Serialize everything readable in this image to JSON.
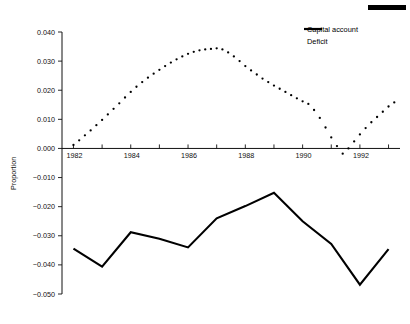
{
  "figure": {
    "artifact_bar": "page-edge-rule"
  },
  "chart_data": {
    "type": "line",
    "title": "",
    "xlabel": "",
    "ylabel": "Proportion",
    "xlim": [
      1981.6,
      1993.4
    ],
    "ylim": [
      -0.05,
      0.04
    ],
    "grid": false,
    "legend_position": "top-right",
    "yticks": [
      0.04,
      0.03,
      0.02,
      0.01,
      0.0,
      -0.01,
      -0.02,
      -0.03,
      -0.04,
      -0.05
    ],
    "ytick_labels": [
      "0.040",
      "0.030",
      "0.020",
      "0.010",
      "0.000",
      "-0.010",
      "-0.020",
      "-0.030",
      "-0.040",
      "-0.050"
    ],
    "xticks": [
      1982,
      1983,
      1984,
      1985,
      1986,
      1987,
      1988,
      1989,
      1990,
      1991,
      1992,
      1993
    ],
    "xtick_labels": [
      "1982",
      "",
      "1984",
      "",
      "1986",
      "",
      "1988",
      "",
      "1990",
      "",
      "1992",
      ""
    ],
    "series": [
      {
        "name": "Capital account",
        "style": "dotted",
        "x": [
          1982.0,
          1982.2,
          1982.4,
          1982.6,
          1982.8,
          1983.0,
          1983.2,
          1983.4,
          1983.6,
          1983.8,
          1984.0,
          1984.2,
          1984.4,
          1984.6,
          1984.8,
          1985.0,
          1985.2,
          1985.4,
          1985.6,
          1985.8,
          1986.0,
          1986.2,
          1986.4,
          1986.6,
          1986.8,
          1987.0,
          1987.2,
          1987.4,
          1987.6,
          1987.8,
          1988.0,
          1988.2,
          1988.4,
          1988.6,
          1988.8,
          1989.0,
          1989.2,
          1989.4,
          1989.6,
          1989.8,
          1990.0,
          1990.2,
          1990.4,
          1990.6,
          1990.8,
          1991.0,
          1991.2,
          1991.4,
          1991.6,
          1991.8,
          1992.0,
          1992.2,
          1992.4,
          1992.6,
          1992.8,
          1993.0,
          1993.2
        ],
        "y": [
          0.0012,
          0.0028,
          0.0045,
          0.0062,
          0.008,
          0.0098,
          0.0117,
          0.0136,
          0.0155,
          0.0175,
          0.0194,
          0.0212,
          0.0228,
          0.0243,
          0.0257,
          0.027,
          0.0283,
          0.0295,
          0.0306,
          0.0316,
          0.0325,
          0.0332,
          0.0337,
          0.034,
          0.0342,
          0.0344,
          0.034,
          0.033,
          0.0316,
          0.03,
          0.0283,
          0.0268,
          0.0254,
          0.024,
          0.0228,
          0.0216,
          0.0205,
          0.0194,
          0.0183,
          0.0172,
          0.0162,
          0.0153,
          0.0132,
          0.0105,
          0.0072,
          0.0038,
          0.0008,
          -0.0018,
          0.0,
          0.0024,
          0.0048,
          0.007,
          0.009,
          0.0108,
          0.0126,
          0.0144,
          0.0158
        ]
      },
      {
        "name": "Deficit",
        "style": "solid",
        "x": [
          1982,
          1983,
          1984,
          1985,
          1986,
          1987,
          1988,
          1989,
          1990,
          1991,
          1992,
          1993
        ],
        "y": [
          -0.0344,
          -0.0406,
          -0.0288,
          -0.031,
          -0.034,
          -0.024,
          -0.0198,
          -0.0152,
          -0.025,
          -0.0328,
          -0.0468,
          -0.0346
        ]
      }
    ]
  },
  "legend": {
    "items": [
      {
        "label": "Capital account",
        "marker": "dotted"
      },
      {
        "label": "Deficit",
        "marker": "solid"
      }
    ]
  }
}
